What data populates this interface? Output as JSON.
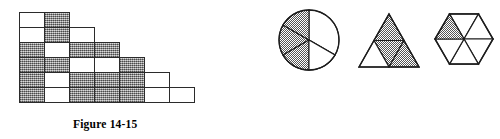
{
  "page": {
    "background_color": "#ffffff",
    "ink_color": "#2b2b2b",
    "shade_color": "#9a9a9a"
  },
  "figures": [
    {
      "id": "figure-14-15",
      "caption": "Figure 14-15",
      "type": "staircase-grid",
      "description": "Staircase arrangement of unit squares, each square either shaded or white",
      "rows": [
        {
          "index": 1,
          "cells": [
            "white",
            "shaded"
          ]
        },
        {
          "index": 2,
          "cells": [
            "white",
            "shaded",
            "white"
          ]
        },
        {
          "index": 3,
          "cells": [
            "shaded",
            "white",
            "shaded",
            "shaded"
          ]
        },
        {
          "index": 4,
          "cells": [
            "shaded",
            "shaded",
            "white",
            "white",
            "shaded"
          ]
        },
        {
          "index": 5,
          "cells": [
            "shaded",
            "white",
            "shaded",
            "shaded",
            "shaded",
            "white"
          ]
        },
        {
          "index": 6,
          "cells": [
            "shaded",
            "white",
            "shaded",
            "shaded",
            "shaded",
            "white",
            "white"
          ]
        }
      ],
      "totals": {
        "squares": 27,
        "shaded": 16,
        "white": 11
      }
    },
    {
      "id": "figure-14-16",
      "caption": "Figure 14-16",
      "type": "shaded-fraction-shapes",
      "shapes": [
        {
          "name": "circle",
          "parts": 6,
          "shaded_parts": 3,
          "shaded_indices": [
            0,
            2,
            4
          ],
          "note": "circle divided into six sectors, alternating sectors shaded"
        },
        {
          "name": "triangle",
          "parts": 4,
          "shaded_parts": 3,
          "shaded_indices": [
            0,
            1,
            3
          ],
          "note": "equilateral triangle split into four small triangles; top, center-inverted and bottom-right shaded"
        },
        {
          "name": "hexagon",
          "parts": 6,
          "shaded_parts": 1,
          "shaded_indices": [
            0
          ],
          "note": "regular hexagon split into six triangles from the center; upper-left triangle shaded"
        }
      ]
    }
  ]
}
